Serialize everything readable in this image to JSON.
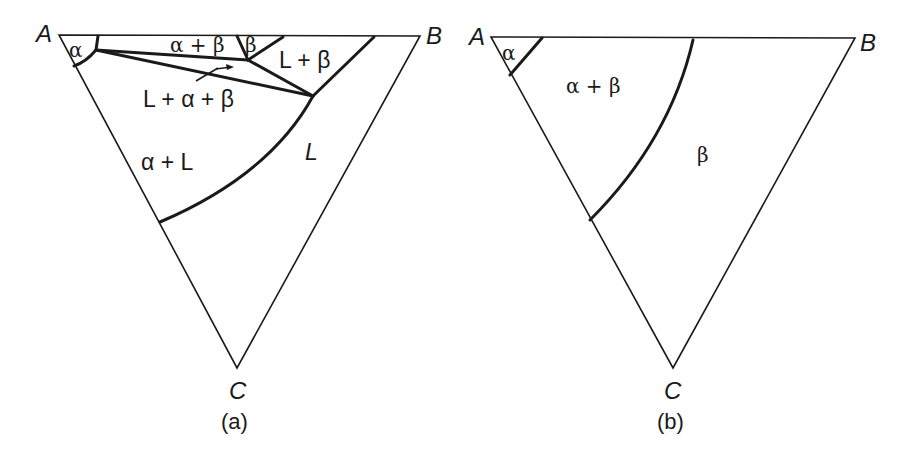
{
  "figure": {
    "panel_a": {
      "caption": "(a)",
      "vertices": {
        "A": "A",
        "B": "B",
        "C": "C"
      },
      "regions": {
        "alpha": "α",
        "alpha_beta": "α + β",
        "beta": "β",
        "L_beta": "L + β",
        "L_alpha_beta": "L + α + β",
        "alpha_L": "α + L",
        "L": "L"
      }
    },
    "panel_b": {
      "caption": "(b)",
      "vertices": {
        "A": "A",
        "B": "B",
        "C": "C"
      },
      "regions": {
        "alpha": "α",
        "alpha_beta": "α + β",
        "beta": "β"
      }
    }
  }
}
